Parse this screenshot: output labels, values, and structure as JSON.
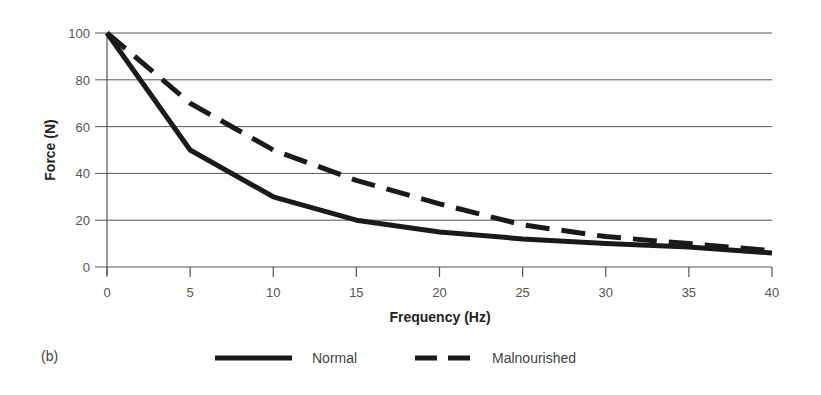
{
  "figure_label": "(b)",
  "chart_data": {
    "type": "line",
    "title": "",
    "xlabel": "Frequency (Hz)",
    "ylabel": "Force (N)",
    "x": [
      0,
      5,
      10,
      15,
      20,
      25,
      30,
      35,
      40
    ],
    "xlim": [
      0,
      40
    ],
    "ylim": [
      0,
      100
    ],
    "xticks": [
      0,
      5,
      10,
      15,
      20,
      25,
      30,
      35,
      40
    ],
    "yticks": [
      0,
      20,
      40,
      60,
      80,
      100
    ],
    "grid": "horizontal",
    "legend_position": "bottom",
    "series": [
      {
        "name": "Normal",
        "style": "solid",
        "color": "#1a1a1a",
        "values": [
          100,
          50,
          30,
          20,
          15,
          12,
          10,
          8.5,
          6
        ]
      },
      {
        "name": "Malnourished",
        "style": "dashed",
        "color": "#1a1a1a",
        "values": [
          100,
          70,
          50,
          37,
          27,
          18,
          13,
          10,
          7
        ]
      }
    ]
  },
  "colors": {
    "gridline": "#555555",
    "axis": "#555555",
    "line": "#1a1a1a"
  }
}
